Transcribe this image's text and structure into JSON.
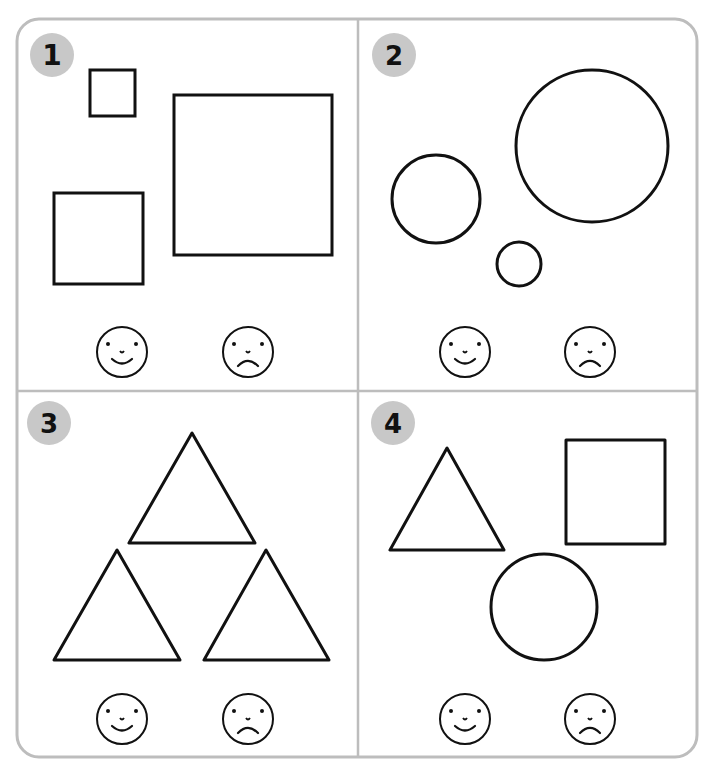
{
  "worksheet": {
    "colors": {
      "frame": "#bdbdbd",
      "badge": "#c8c8c8",
      "ink": "#111111"
    },
    "panels": [
      {
        "number": "1",
        "shapes": "three squares of different sizes",
        "faces": [
          "happy",
          "sad"
        ]
      },
      {
        "number": "2",
        "shapes": "three circles of different sizes",
        "faces": [
          "happy",
          "sad"
        ]
      },
      {
        "number": "3",
        "shapes": "three equal triangles",
        "faces": [
          "happy",
          "sad"
        ]
      },
      {
        "number": "4",
        "shapes": "triangle, square, circle",
        "faces": [
          "happy",
          "sad"
        ]
      }
    ]
  }
}
